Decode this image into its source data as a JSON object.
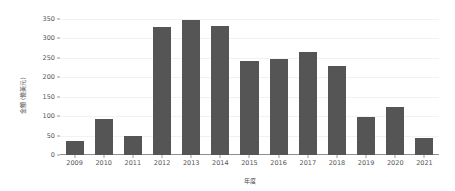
{
  "chart_data": {
    "type": "bar",
    "title": "",
    "subtitle": "",
    "xlabel": "年度",
    "ylabel": "金額 (億美元)",
    "categories": [
      "2009",
      "2010",
      "2011",
      "2012",
      "2013",
      "2014",
      "2015",
      "2016",
      "2017",
      "2018",
      "2019",
      "2020",
      "2021"
    ],
    "values": [
      37,
      93,
      50,
      330,
      348,
      332,
      243,
      246,
      265,
      230,
      97,
      123,
      45
    ],
    "series": [
      {
        "name": "金額",
        "values": [
          37,
          93,
          50,
          330,
          348,
          332,
          243,
          246,
          265,
          230,
          97,
          123,
          45
        ]
      }
    ],
    "ylim": [
      0,
      350
    ],
    "yticks": [
      0,
      50,
      100,
      150,
      200,
      250,
      300,
      350
    ],
    "ytick_labels": [
      "0",
      "50",
      "100",
      "150",
      "200",
      "250",
      "300",
      "350"
    ],
    "grid": true,
    "grid_axis": "y",
    "legend": false,
    "legend_position": "none",
    "bar_color": "#555555",
    "grid_color": "#f2f2f2",
    "axis_color": "#8f8f8f",
    "background_color": "#ffffff",
    "text_color": "#555555"
  }
}
